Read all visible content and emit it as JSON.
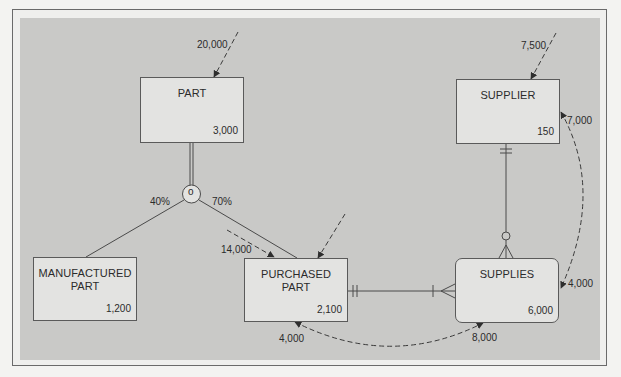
{
  "entities": [
    {
      "id": "part",
      "name": "PART",
      "volume": "3,000",
      "type": "entity"
    },
    {
      "id": "manufactured_part",
      "name": "MANUFACTURED\nPART",
      "volume": "1,200",
      "type": "entity"
    },
    {
      "id": "purchased_part",
      "name": "PURCHASED\nPART",
      "volume": "2,100",
      "type": "entity"
    },
    {
      "id": "supplier",
      "name": "SUPPLIER",
      "volume": "150",
      "type": "entity"
    },
    {
      "id": "supplies",
      "name": "SUPPLIES",
      "volume": "6,000",
      "type": "associative-entity"
    }
  ],
  "subtype": {
    "symbol": "o",
    "manufactured_pct": "40%",
    "purchased_pct": "70%"
  },
  "access_paths": {
    "part_in": "20,000",
    "supplier_in": "7,500",
    "purchased_part_in": "6,000",
    "part_to_purchased": "14,000",
    "supplies_to_supplier": "7,000",
    "supplier_to_supplies": "4,000",
    "purchased_to_supplies": "8,000",
    "supplies_to_purchased": "4,000"
  },
  "relationships": [
    {
      "from": "purchased_part",
      "to": "supplies",
      "from_cardinality": "mandatory-one",
      "to_cardinality": "mandatory-many"
    },
    {
      "from": "supplier",
      "to": "supplies",
      "from_cardinality": "mandatory-one",
      "to_cardinality": "optional-many"
    }
  ],
  "colors": {
    "panel": "#c9c9c7",
    "box_fill": "#e3e3e1",
    "line": "#4a4a4a",
    "dashed": "#3a3a3a"
  }
}
